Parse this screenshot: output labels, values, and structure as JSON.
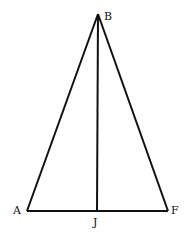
{
  "diagram": {
    "type": "isosceles triangle with altitude",
    "stroke_color": "#111111",
    "background": "#ffffff",
    "points": {
      "B": {
        "label": "B",
        "x": 98,
        "y": 14
      },
      "A": {
        "label": "A",
        "x": 27,
        "y": 211
      },
      "F": {
        "label": "F",
        "x": 168,
        "y": 211
      },
      "J": {
        "label": "J",
        "x": 97,
        "y": 211
      }
    },
    "segments": [
      {
        "from": "A",
        "to": "B"
      },
      {
        "from": "B",
        "to": "F"
      },
      {
        "from": "A",
        "to": "F"
      },
      {
        "from": "B",
        "to": "J"
      }
    ]
  }
}
